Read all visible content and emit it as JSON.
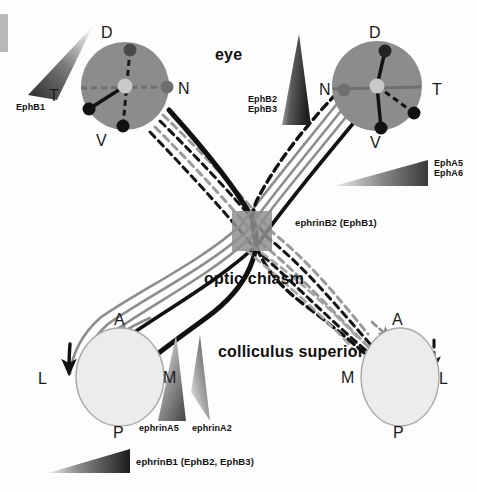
{
  "figure": {
    "title_labels": {
      "eye": "eye",
      "optic_chiasm": "optic chiasm",
      "colliculus_superior": "colliculus superior"
    },
    "colors": {
      "retina_fill": "#8c8c8c",
      "retina_stroke": "#8c8c8c",
      "optic_disc": "#c9c9c9",
      "chiasm_square": "#8f8f8f",
      "colliculus_fill": "#ececec",
      "colliculus_stroke": "#9a9a9a",
      "fiber_black": "#111111",
      "fiber_gray": "#8a8a8a",
      "gradient_dark": "#2b2b2b",
      "gradient_light": "#f2f2f2",
      "background": "#fdfdfd",
      "edge_bar": "#b9b9b9"
    }
  },
  "left_eye": {
    "name": "left-retina",
    "axis_labels": {
      "dorsal": "D",
      "ventral": "V",
      "nasal": "N",
      "temporal": "T"
    },
    "center": {
      "x": 125,
      "y": 86
    },
    "radius": 44,
    "dots": [
      {
        "name": "dorsal-dot",
        "x": 130,
        "y": 50,
        "color": "#4a4a4a",
        "r": 6
      },
      {
        "name": "ventral-dot",
        "x": 123,
        "y": 126,
        "color": "#111111",
        "r": 6
      },
      {
        "name": "nasal-dot",
        "x": 167,
        "y": 87,
        "color": "#6e6e6e",
        "r": 6
      },
      {
        "name": "temporal-dot",
        "x": 89,
        "y": 109,
        "color": "#111111",
        "r": 6
      }
    ]
  },
  "right_eye": {
    "name": "right-retina",
    "axis_labels": {
      "dorsal": "D",
      "ventral": "V",
      "nasal": "N",
      "temporal": "T"
    },
    "center": {
      "x": 377,
      "y": 86
    },
    "radius": 45,
    "dots": [
      {
        "name": "dorsal-dot",
        "x": 385,
        "y": 51,
        "color": "#222222",
        "r": 6
      },
      {
        "name": "ventral-dot",
        "x": 381,
        "y": 128,
        "color": "#111111",
        "r": 6
      },
      {
        "name": "nasal-dot",
        "x": 344,
        "y": 90,
        "color": "#6e6e6e",
        "r": 6
      },
      {
        "name": "temporal-dot",
        "x": 414,
        "y": 113,
        "color": "#111111",
        "r": 6
      }
    ]
  },
  "left_colliculus": {
    "name": "left-superior-colliculus",
    "axis_labels": {
      "anterior": "A",
      "posterior": "P",
      "lateral": "L",
      "medial": "M"
    },
    "center": {
      "x": 120,
      "y": 377
    },
    "rx": 44,
    "ry": 49
  },
  "right_colliculus": {
    "name": "right-superior-colliculus",
    "axis_labels": {
      "anterior": "A",
      "posterior": "P",
      "lateral": "L",
      "medial": "M"
    },
    "center": {
      "x": 400,
      "y": 377
    },
    "rx": 39,
    "ry": 49
  },
  "gradients": [
    {
      "id": "ephb1",
      "name": "ephb1-gradient-triangle",
      "label": "EphB1",
      "label_x": 16,
      "label_y": 107,
      "orientation": "diagonal-up-right, dark at lower-left"
    },
    {
      "id": "ephb2b3",
      "name": "ephb2-ephb3-gradient-triangle",
      "label": "EphB2\nEphB3",
      "label_x": 248,
      "label_y": 99,
      "orientation": "vertical, wide and dark at bottom"
    },
    {
      "id": "epha5a6",
      "name": "epha5-epha6-gradient-triangle",
      "label": "EphA5\nEphA6",
      "label_x": 434,
      "label_y": 163,
      "orientation": "horizontal, dark and tall at right"
    },
    {
      "id": "ephrina5",
      "name": "ephrina5-gradient-triangle",
      "label": "ephrinA5",
      "label_x": 139,
      "label_y": 428,
      "orientation": "vertical, wide and dark at bottom"
    },
    {
      "id": "ephrina2",
      "name": "ephrina2-gradient-triangle",
      "label": "ephrinA2",
      "label_x": 192,
      "label_y": 428,
      "orientation": "vertical mirrored, dark at upper-right"
    },
    {
      "id": "ephrinb1",
      "name": "ephrinb1-gradient-triangle",
      "label": "ephrinB1 (EphB2, EphB3)",
      "label_x": 136,
      "label_y": 461,
      "orientation": "horizontal, dark and tall at right"
    },
    {
      "id": "ephrinb2",
      "name": "ephrinb2-chiasm-label",
      "label": "ephrinB2 (EphB1)",
      "label_x": 295,
      "label_y": 222,
      "orientation": "text label pointing at optic chiasm"
    }
  ],
  "chiasm": {
    "name": "optic-chiasm-square",
    "x": 232,
    "y": 211,
    "width": 40,
    "height": 40
  }
}
